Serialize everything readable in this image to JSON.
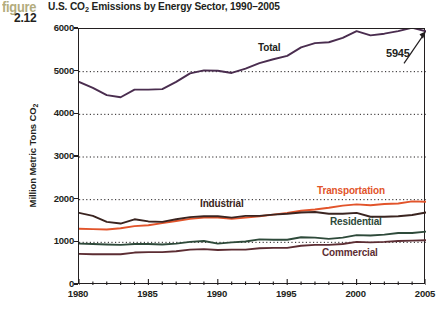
{
  "figure": {
    "word": "figure",
    "number": "2.12",
    "word_color": "#b3ac7d",
    "number_color": "#231f20"
  },
  "title": {
    "prefix": "U.S. CO",
    "subscript": "2",
    "suffix": " Emissions by Energy Sector, 1990–2005",
    "full": "U.S. CO2 Emissions by Energy Sector, 1990–2005"
  },
  "callout": {
    "value_label": "5945"
  },
  "chart_data": {
    "type": "line",
    "title": "U.S. CO2 Emissions by Energy Sector, 1990–2005",
    "xlabel": "",
    "ylabel": "Million Metric Tons CO2",
    "ylabel_prefix": "Million Metric Tons CO",
    "ylabel_subscript": "2",
    "xlim": [
      1980,
      2005
    ],
    "ylim": [
      0,
      6000
    ],
    "ytick_labels": [
      "0",
      "1000",
      "2000",
      "3000",
      "4000",
      "5000",
      "6000"
    ],
    "yticks": [
      0,
      1000,
      2000,
      3000,
      4000,
      5000,
      6000
    ],
    "xtick_labels": [
      "1980",
      "1985",
      "1990",
      "1995",
      "2000",
      "2005"
    ],
    "xticks": [
      1980,
      1985,
      1990,
      1995,
      2000,
      2005
    ],
    "xticks_minor_interval": 1,
    "grid": "horizontal-dotted",
    "legend": "inline-annotations",
    "x": [
      1980,
      1981,
      1982,
      1983,
      1984,
      1985,
      1986,
      1987,
      1988,
      1989,
      1990,
      1991,
      1992,
      1993,
      1994,
      1995,
      1996,
      1997,
      1998,
      1999,
      2000,
      2001,
      2002,
      2003,
      2004,
      2005
    ],
    "series": [
      {
        "name": "Total",
        "color": "#4a2d4f",
        "label_color": "#231f20",
        "values": [
          4760,
          4620,
          4450,
          4400,
          4580,
          4580,
          4590,
          4760,
          4960,
          5030,
          5020,
          4970,
          5070,
          5200,
          5290,
          5370,
          5570,
          5670,
          5690,
          5790,
          5950,
          5850,
          5890,
          5950,
          6030,
          5945
        ],
        "end_label": "5945"
      },
      {
        "name": "Transportation",
        "color": "#e2542b",
        "label_color": "#e2542b",
        "values": [
          1320,
          1310,
          1300,
          1330,
          1380,
          1400,
          1450,
          1500,
          1550,
          1580,
          1580,
          1550,
          1580,
          1610,
          1650,
          1690,
          1740,
          1770,
          1810,
          1860,
          1890,
          1870,
          1900,
          1910,
          1960,
          1950
        ]
      },
      {
        "name": "Industrial",
        "color": "#3a2420",
        "label_color": "#3a2420",
        "values": [
          1690,
          1620,
          1480,
          1440,
          1540,
          1490,
          1480,
          1540,
          1590,
          1610,
          1610,
          1580,
          1620,
          1620,
          1650,
          1670,
          1700,
          1710,
          1670,
          1670,
          1690,
          1600,
          1600,
          1610,
          1640,
          1700
        ]
      },
      {
        "name": "Residential",
        "color": "#2e4a3a",
        "label_color": "#2e4a3a",
        "values": [
          970,
          960,
          950,
          940,
          960,
          960,
          950,
          970,
          1010,
          1030,
          970,
          1000,
          1020,
          1070,
          1060,
          1060,
          1120,
          1110,
          1080,
          1110,
          1170,
          1160,
          1180,
          1220,
          1220,
          1250
        ]
      },
      {
        "name": "Commercial",
        "color": "#5c2d33",
        "label_color": "#5c2d33",
        "values": [
          730,
          720,
          720,
          720,
          760,
          770,
          770,
          790,
          830,
          840,
          820,
          830,
          830,
          860,
          870,
          870,
          920,
          940,
          940,
          960,
          1010,
          1000,
          1010,
          1030,
          1040,
          1050
        ]
      }
    ]
  }
}
